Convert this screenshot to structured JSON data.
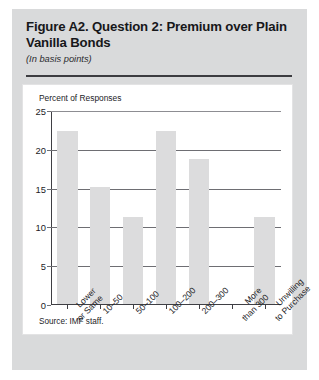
{
  "figure": {
    "title": "Figure A2. Question 2: Premium over Plain Vanilla Bonds",
    "subtitle": "(In basis points)",
    "source": "Source: IMF staff."
  },
  "colors": {
    "card_background": "#d9dadb",
    "panel_background": "#ffffff",
    "bar_fill": "#dcdcdd",
    "gridline": "#6e6e73",
    "axis": "#3f3f44",
    "text": "#1c1c1f",
    "rule": "#3c3c40"
  },
  "chart_data": {
    "type": "bar",
    "title": "Figure A2. Question 2: Premium over Plain Vanilla Bonds",
    "subtitle": "(In basis points)",
    "xlabel": "",
    "ylabel": "Percent of Responses",
    "categories": [
      "Lower or Same",
      "10–50",
      "50–100",
      "100–200",
      "200–300",
      "More than 300",
      "Unwilling to Purchase"
    ],
    "category_lines": [
      [
        "Lower",
        "or Same"
      ],
      [
        "10–50"
      ],
      [
        "50–100"
      ],
      [
        "100–200"
      ],
      [
        "200–300"
      ],
      [
        "More",
        "than 300"
      ],
      [
        "Unwilling",
        "to Purchase"
      ]
    ],
    "values": [
      22.3,
      15.1,
      11.2,
      22.3,
      18.7,
      0,
      11.2
    ],
    "ylim": [
      0,
      25
    ],
    "yticks": [
      0,
      5,
      10,
      15,
      20,
      25
    ],
    "ytick_labels": [
      "0",
      "5",
      "10",
      "15",
      "20",
      "25"
    ],
    "grid": true,
    "legend": false,
    "source": "Source: IMF staff."
  }
}
